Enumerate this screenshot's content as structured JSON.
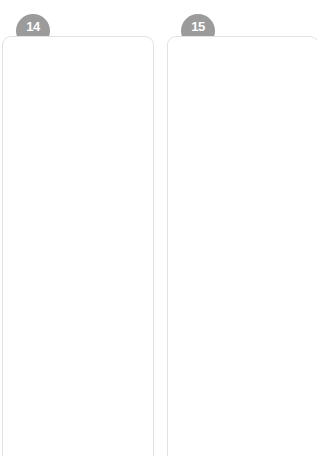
{
  "page": {
    "background_color": "#ffffff"
  },
  "style": {
    "badge_color": "#9b9b9b",
    "badge_text_color": "#ffffff",
    "card_border_color": "#e2e2e2",
    "grid_major_color": "#dcdcdc",
    "grid_minor_color": "#e9e9e9",
    "grid_border_color": "#d5d5d5",
    "shape_stroke_color": "#333333",
    "fold_line_color": "#8c8c8c",
    "arrow_color": "#6f6f6f"
  },
  "exercises": [
    {
      "number": "14",
      "badge_name": "exercise-badge-14",
      "grids": [
        {
          "name": "answer-grid-top",
          "cols": 5,
          "rows": 5,
          "shape": null
        },
        {
          "name": "source-grid-middle",
          "cols": 5,
          "rows": 5,
          "shape": {
            "type": "triangle",
            "name": "triangle-shape",
            "points": "29,18 100,45 48,98"
          }
        },
        {
          "name": "answer-grid-bottom",
          "cols": 5,
          "rows": 5,
          "shape": null
        }
      ],
      "fold_lines": [
        {
          "name": "fold-line-upper",
          "symbol": "rotation-arrow-icon"
        },
        {
          "name": "fold-line-lower",
          "symbol": "rotation-arrow-icon"
        }
      ]
    },
    {
      "number": "15",
      "badge_name": "exercise-badge-15",
      "grids": [
        {
          "name": "answer-grid-top",
          "cols": 5,
          "rows": 5,
          "shape": null
        },
        {
          "name": "source-grid-middle",
          "cols": 5,
          "rows": 5,
          "shape": {
            "type": "polygon",
            "name": "l-shaped-polygon",
            "points": "12,43 29,43 29,22 65,22 65,64 86,64 86,85 12,85"
          }
        },
        {
          "name": "answer-grid-bottom",
          "cols": 5,
          "rows": 5,
          "shape": null
        }
      ],
      "fold_lines": [
        {
          "name": "fold-line-upper",
          "symbol": "rotation-arrow-icon"
        },
        {
          "name": "fold-line-lower",
          "symbol": "rotation-arrow-icon"
        }
      ]
    }
  ]
}
